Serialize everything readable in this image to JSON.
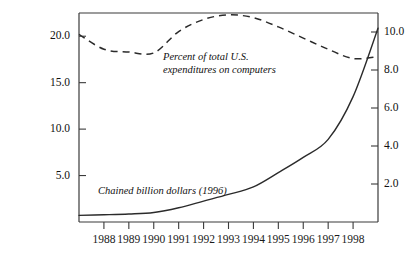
{
  "chart_data": {
    "type": "line",
    "title": "",
    "xlabel": "",
    "grid": false,
    "legend_position": "inline-annotations",
    "x": [
      1987,
      1988,
      1989,
      1990,
      1991,
      1992,
      1993,
      1994,
      1995,
      1996,
      1997,
      1998,
      1999
    ],
    "xticks": [
      "1988",
      "1989",
      "1990",
      "1991",
      "1992",
      "1993",
      "1994",
      "1995",
      "1996",
      "1997",
      "1998"
    ],
    "xlim": [
      1987,
      1999
    ],
    "axes": {
      "left": {
        "label": "",
        "ticks": [
          "20.0",
          "15.0",
          "10.0",
          "5.0"
        ],
        "tick_values": [
          20.0,
          15.0,
          10.0,
          5.0
        ],
        "lim": [
          0.0,
          22.5
        ]
      },
      "right": {
        "label": "",
        "ticks": [
          "10.0",
          "8.0",
          "6.0",
          "4.0",
          "2.0"
        ],
        "tick_values": [
          10.0,
          8.0,
          6.0,
          4.0,
          2.0
        ],
        "lim": [
          0.0,
          11.0
        ]
      }
    },
    "series": [
      {
        "name": "Percent of total U.S. expenditures on computers",
        "axis": "left",
        "style": "dashed",
        "annotation": "Percent of total U.S.\nexpenditures on computers",
        "values": [
          20.2,
          18.6,
          18.3,
          18.2,
          20.5,
          21.8,
          22.3,
          22.0,
          21.0,
          19.8,
          18.6,
          17.6,
          17.8
        ]
      },
      {
        "name": "Chained billion dollars (1996)",
        "axis": "right",
        "style": "solid",
        "annotation": "Chained billion dollars (1996)",
        "values": [
          0.35,
          0.38,
          0.42,
          0.5,
          0.75,
          1.1,
          1.45,
          1.85,
          2.6,
          3.4,
          4.35,
          6.6,
          10.2
        ]
      }
    ]
  }
}
